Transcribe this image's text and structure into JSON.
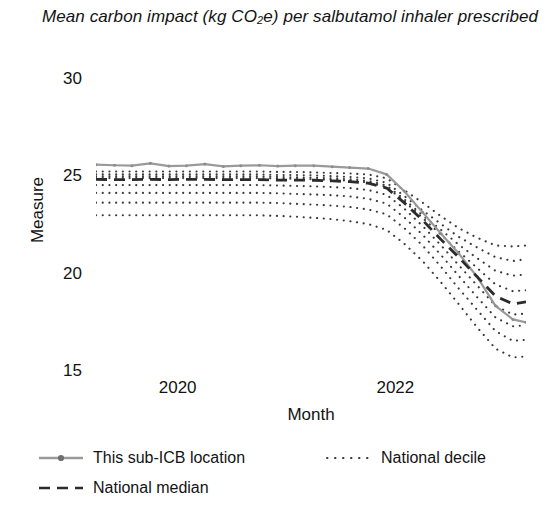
{
  "chart_data": {
    "type": "line",
    "title": "Mean carbon impact (kg CO2e) per salbutamol inhaler prescribed",
    "title_prefix": "Mean carbon impact (kg CO",
    "title_sub": "2",
    "title_suffix": "e) per salbutamol inhaler prescribed",
    "xlabel": "Month",
    "ylabel": "Measure",
    "ylim": [
      15,
      30
    ],
    "yticks": [
      30,
      25,
      20,
      15
    ],
    "ytick_labels": [
      "30",
      "25",
      "20",
      "15"
    ],
    "xlim": [
      2019.25,
      2023.2
    ],
    "xticks": [
      2020,
      2022
    ],
    "xtick_labels": [
      "2020",
      "2022"
    ],
    "grid": false,
    "legend_position": "below",
    "colors": {
      "this_location": "#9a9a9a",
      "national_median": "#2b2b2b",
      "national_decile": "#3a3a3a",
      "axis_text": "#131313"
    },
    "x": [
      2019.25,
      2019.42,
      2019.58,
      2019.75,
      2019.92,
      2020.08,
      2020.25,
      2020.42,
      2020.58,
      2020.75,
      2020.92,
      2021.08,
      2021.25,
      2021.42,
      2021.58,
      2021.75,
      2021.92,
      2022.08,
      2022.25,
      2022.42,
      2022.58,
      2022.75,
      2022.92,
      2023.08,
      2023.2
    ],
    "series": [
      {
        "name": "This sub-ICB location",
        "style": "solid-marker",
        "color": "#9a9a9a",
        "values": [
          25.65,
          25.62,
          25.6,
          25.72,
          25.58,
          25.6,
          25.68,
          25.56,
          25.6,
          25.62,
          25.58,
          25.6,
          25.6,
          25.55,
          25.5,
          25.45,
          25.15,
          24.3,
          23.2,
          22.1,
          21.1,
          19.9,
          18.4,
          17.7,
          17.55
        ]
      },
      {
        "name": "National median",
        "style": "dashed",
        "color": "#2b2b2b",
        "values": [
          24.9,
          24.88,
          24.88,
          24.9,
          24.88,
          24.9,
          24.9,
          24.88,
          24.88,
          24.88,
          24.86,
          24.86,
          24.85,
          24.82,
          24.78,
          24.7,
          24.45,
          23.7,
          22.8,
          21.8,
          20.9,
          19.9,
          18.9,
          18.5,
          18.6
        ]
      }
    ],
    "deciles": [
      {
        "name": "decile-90",
        "values": [
          25.3,
          25.3,
          25.3,
          25.3,
          25.3,
          25.3,
          25.3,
          25.3,
          25.3,
          25.3,
          25.28,
          25.28,
          25.25,
          25.22,
          25.2,
          25.15,
          24.95,
          24.35,
          23.7,
          23.0,
          22.4,
          21.9,
          21.5,
          21.45,
          21.5
        ]
      },
      {
        "name": "decile-80",
        "values": [
          25.15,
          25.15,
          25.15,
          25.15,
          25.15,
          25.15,
          25.15,
          25.15,
          25.15,
          25.15,
          25.12,
          25.12,
          25.1,
          25.06,
          25.02,
          24.95,
          24.72,
          24.05,
          23.3,
          22.6,
          21.95,
          21.4,
          20.9,
          20.7,
          20.8
        ]
      },
      {
        "name": "decile-70",
        "values": [
          25.05,
          25.05,
          25.05,
          25.05,
          25.05,
          25.05,
          25.05,
          25.05,
          25.05,
          25.05,
          25.02,
          25.0,
          24.98,
          24.95,
          24.9,
          24.82,
          24.58,
          23.88,
          23.05,
          22.3,
          21.55,
          20.85,
          20.2,
          19.95,
          20.0
        ]
      },
      {
        "name": "decile-60",
        "values": [
          24.96,
          24.96,
          24.96,
          24.96,
          24.96,
          24.96,
          24.96,
          24.96,
          24.96,
          24.96,
          24.94,
          24.92,
          24.9,
          24.87,
          24.82,
          24.74,
          24.5,
          23.78,
          22.92,
          22.05,
          21.2,
          20.35,
          19.5,
          19.15,
          19.2
        ]
      },
      {
        "name": "decile-50",
        "values": [
          24.9,
          24.88,
          24.88,
          24.9,
          24.88,
          24.9,
          24.9,
          24.88,
          24.88,
          24.88,
          24.86,
          24.86,
          24.85,
          24.82,
          24.78,
          24.7,
          24.45,
          23.7,
          22.8,
          21.8,
          20.9,
          19.9,
          18.9,
          18.5,
          18.6
        ]
      },
      {
        "name": "decile-40",
        "values": [
          24.6,
          24.6,
          24.6,
          24.6,
          24.6,
          24.6,
          24.6,
          24.6,
          24.6,
          24.6,
          24.58,
          24.56,
          24.54,
          24.5,
          24.45,
          24.35,
          24.1,
          23.4,
          22.5,
          21.5,
          20.5,
          19.45,
          18.4,
          17.95,
          18.0
        ]
      },
      {
        "name": "decile-30",
        "values": [
          24.2,
          24.2,
          24.2,
          24.2,
          24.2,
          24.2,
          24.2,
          24.2,
          24.2,
          24.2,
          24.18,
          24.15,
          24.12,
          24.08,
          24.02,
          23.9,
          23.65,
          22.95,
          22.05,
          21.0,
          19.95,
          18.85,
          17.8,
          17.35,
          17.4
        ]
      },
      {
        "name": "decile-20",
        "values": [
          23.7,
          23.7,
          23.7,
          23.7,
          23.7,
          23.7,
          23.7,
          23.7,
          23.7,
          23.7,
          23.68,
          23.64,
          23.6,
          23.55,
          23.48,
          23.35,
          23.1,
          22.4,
          21.5,
          20.4,
          19.3,
          18.2,
          17.1,
          16.6,
          16.65
        ]
      },
      {
        "name": "decile-10",
        "values": [
          23.05,
          23.05,
          23.05,
          23.05,
          23.05,
          23.05,
          23.05,
          23.05,
          23.05,
          23.05,
          23.02,
          22.98,
          22.92,
          22.85,
          22.75,
          22.6,
          22.3,
          21.6,
          20.7,
          19.6,
          18.5,
          17.3,
          16.2,
          15.75,
          15.8
        ]
      }
    ],
    "legend": [
      {
        "label": "This sub-ICB location",
        "style": "solid-marker"
      },
      {
        "label": "National decile",
        "style": "dotted"
      },
      {
        "label": "National median",
        "style": "dashed"
      }
    ]
  }
}
